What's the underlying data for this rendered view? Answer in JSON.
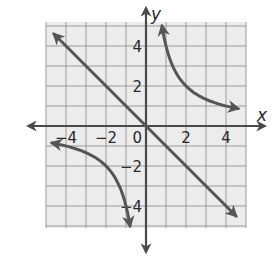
{
  "chart_data": {
    "type": "line",
    "title": "",
    "xlabel": "x",
    "ylabel": "y",
    "xlim": [
      -5,
      5
    ],
    "ylim": [
      -5,
      5
    ],
    "grid": true,
    "grid_step": 1,
    "x_ticks": [
      -4,
      -2,
      0,
      2,
      4
    ],
    "y_ticks": [
      4,
      2,
      -2,
      -4
    ],
    "origin_label": "0",
    "series": [
      {
        "name": "y = -x",
        "kind": "line",
        "arrows": "both",
        "points": [
          [
            -4.6,
            4.6
          ],
          [
            4.5,
            -4.5
          ]
        ]
      },
      {
        "name": "y = 4/x (quadrant I branch)",
        "kind": "curve",
        "arrows": "both",
        "x": [
          0.8,
          1,
          1.5,
          2,
          2.5,
          3,
          3.5,
          4,
          4.6
        ],
        "values": [
          5,
          4,
          2.67,
          2,
          1.6,
          1.33,
          1.14,
          1,
          0.87
        ]
      },
      {
        "name": "y = 4/x (quadrant III branch)",
        "kind": "curve",
        "arrows": "both",
        "x": [
          -4.7,
          -4,
          -3.5,
          -3,
          -2.5,
          -2,
          -1.5,
          -1,
          -0.8
        ],
        "values": [
          -0.85,
          -1,
          -1.14,
          -1.33,
          -1.6,
          -2,
          -2.67,
          -4,
          -5
        ]
      }
    ],
    "colors": {
      "grid_background": "#ececec",
      "grid_lines": "#9a9a9a",
      "axes": "#4a4a4a",
      "curves": "#555555",
      "text": "#2a2a2a"
    }
  }
}
